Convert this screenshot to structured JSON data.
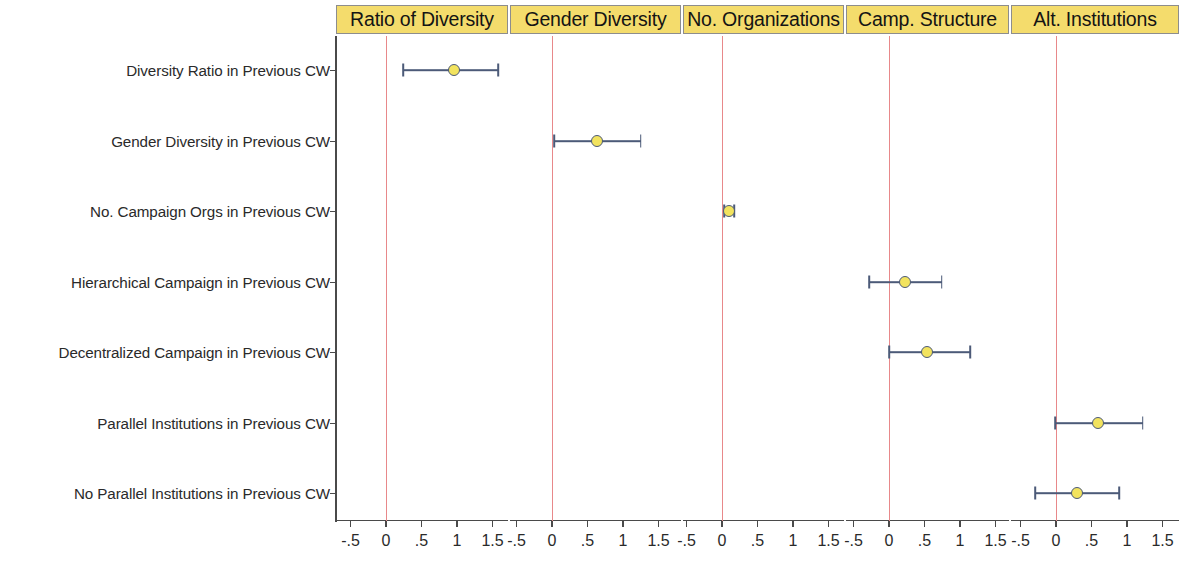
{
  "figure": {
    "type": "coefficient-plot",
    "panel_header_color": "#F4DC6C",
    "zero_line_color": "#e8888a",
    "marker_fill_color": "#F2E35E",
    "marker_edge_color": "#4c5a78"
  },
  "chart_data": {
    "type": "scatter",
    "title": "",
    "subtitle": "",
    "xlabel": "",
    "ylabel": "",
    "grid": false,
    "legend": "none",
    "xlim": [
      -0.75,
      1.75
    ],
    "xticks": [
      -0.5,
      0,
      0.5,
      1,
      1.5
    ],
    "xtick_labels": [
      "-.5",
      "0",
      ".5",
      "1",
      "1.5"
    ],
    "zero_reference": 0,
    "panels": [
      {
        "id": "ratio-of-diversity",
        "label": "Ratio of Diversity",
        "points": [
          {
            "row": "Diversity Ratio in Previous CW",
            "estimate": 0.96,
            "ci_low": 0.24,
            "ci_high": 1.58
          }
        ]
      },
      {
        "id": "gender-diversity",
        "label": "Gender Diversity",
        "points": [
          {
            "row": "Gender Diversity in Previous CW",
            "estimate": 0.64,
            "ci_low": 0.03,
            "ci_high": 1.25
          }
        ]
      },
      {
        "id": "no-organizations",
        "label": "No. Organizations",
        "points": [
          {
            "row": "No. Campaign Orgs in Previous CW",
            "estimate": 0.1,
            "ci_low": 0.03,
            "ci_high": 0.17
          }
        ]
      },
      {
        "id": "camp-structure",
        "label": "Camp. Structure",
        "points": [
          {
            "row": "Hierarchical Campaign in Previous CW",
            "estimate": 0.23,
            "ci_low": -0.28,
            "ci_high": 0.74
          },
          {
            "row": "Decentralized Campaign in Previous CW",
            "estimate": 0.53,
            "ci_low": 0.0,
            "ci_high": 1.14
          }
        ]
      },
      {
        "id": "alt-institutions",
        "label": "Alt. Institutions",
        "points": [
          {
            "row": "Parallel Institutions in Previous CW",
            "estimate": 0.59,
            "ci_low": -0.01,
            "ci_high": 1.22
          },
          {
            "row": "No Parallel Institutions in Previous CW",
            "estimate": 0.3,
            "ci_low": -0.29,
            "ci_high": 0.89
          }
        ]
      }
    ],
    "rows": [
      {
        "id": "diversity-ratio",
        "label": "Diversity Ratio in Previous CW",
        "panel": "ratio-of-diversity"
      },
      {
        "id": "gender-diversity",
        "label": "Gender Diversity in Previous CW",
        "panel": "gender-diversity"
      },
      {
        "id": "no-campaign-orgs",
        "label": "No. Campaign Orgs in Previous CW",
        "panel": "no-organizations"
      },
      {
        "id": "hierarchical-campaign",
        "label": "Hierarchical Campaign in Previous CW",
        "panel": "camp-structure"
      },
      {
        "id": "decentralized-campaign",
        "label": "Decentralized Campaign in Previous CW",
        "panel": "camp-structure"
      },
      {
        "id": "parallel-institutions",
        "label": "Parallel Institutions in Previous CW",
        "panel": "alt-institutions"
      },
      {
        "id": "no-parallel-institutions",
        "label": "No Parallel Institutions in Previous CW",
        "panel": "alt-institutions"
      }
    ]
  }
}
